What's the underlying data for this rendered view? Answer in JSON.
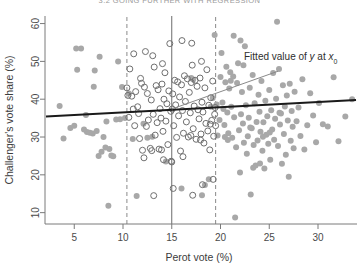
{
  "page_header": "3.2   GOING FURTHER WITH REGRESSION",
  "chart_data": {
    "type": "scatter",
    "title": "",
    "xlabel": "Perot vote (%)",
    "ylabel": "Challenger's vote share (%)",
    "xlim": [
      2.0,
      34.0
    ],
    "ylim": [
      7.0,
      62.0
    ],
    "xticks": [
      5,
      10,
      15,
      20,
      25,
      30
    ],
    "xtick_labels": [
      "5",
      "10",
      "15",
      "20",
      "25",
      "30"
    ],
    "yticks": [
      10,
      20,
      30,
      40,
      50,
      60
    ],
    "ytick_labels": [
      "10",
      "20",
      "30",
      "40",
      "50",
      "60"
    ],
    "grid": false,
    "legend": "none",
    "colors": {
      "filled_point": "#a8a8a8",
      "open_point_stroke": "#6f6f6f",
      "regression_line": "#1a1a1a",
      "local_line": "#8a8a8a",
      "reference_line_solid": "#6b6b6b",
      "reference_line_dashed": "#8a8a8a",
      "axis": "#7a7a7a",
      "text": "#3c3c3c"
    },
    "annotations": [
      {
        "name": "fitted-value-annotation",
        "text_parts": [
          "Fitted value of ",
          "y",
          " at ",
          "x",
          "0"
        ],
        "text": "Fitted value of y at x0",
        "x": 22.2,
        "y": 49.5
      }
    ],
    "reference_lines": [
      {
        "name": "x0-solid-line",
        "type": "vertical",
        "style": "solid",
        "x": 15.0
      },
      {
        "name": "bandwidth-lower-dashed-line",
        "type": "vertical",
        "style": "dashed",
        "x": 10.4
      },
      {
        "name": "bandwidth-upper-dashed-line",
        "type": "vertical",
        "style": "dashed",
        "x": 19.5
      }
    ],
    "fitted_lines": [
      {
        "name": "global-regression-line",
        "style": "thick-solid",
        "x_start": 2.1,
        "y_start": 35.4,
        "x_end": 33.9,
        "y_end": 39.8
      },
      {
        "name": "local-regression-line",
        "style": "thin-solid",
        "x_start": 15.0,
        "y_start": 37.4,
        "x_end": 25.9,
        "y_end": 47.4
      }
    ],
    "series": [
      {
        "name": "All districts",
        "marker": "filled-circle",
        "color": "#a8a8a8",
        "points": [
          [
            3.5,
            38.2
          ],
          [
            3.9,
            29.6
          ],
          [
            4.6,
            32.4
          ],
          [
            5.2,
            53.4
          ],
          [
            5.3,
            47.8
          ],
          [
            5.7,
            53.4
          ],
          [
            6.2,
            35.8
          ],
          [
            6.3,
            31.3
          ],
          [
            6.6,
            31.1
          ],
          [
            6.9,
            30.9
          ],
          [
            7.0,
            43.3
          ],
          [
            7.1,
            47.6
          ],
          [
            7.3,
            31.6
          ],
          [
            7.6,
            51.2
          ],
          [
            7.8,
            26.1
          ],
          [
            8.0,
            30.0
          ],
          [
            8.2,
            27.2
          ],
          [
            8.3,
            34.1
          ],
          [
            8.5,
            11.8
          ],
          [
            8.6,
            26.8
          ],
          [
            8.8,
            25.1
          ],
          [
            9.0,
            24.9
          ],
          [
            9.3,
            34.6
          ],
          [
            9.5,
            50.0
          ],
          [
            9.7,
            34.7
          ],
          [
            9.9,
            43.2
          ],
          [
            10.2,
            35.0
          ],
          [
            10.6,
            41.5
          ],
          [
            11.0,
            29.5
          ],
          [
            11.4,
            14.4
          ],
          [
            12.1,
            33.5
          ],
          [
            13.0,
            30.1
          ],
          [
            14.4,
            23.5
          ],
          [
            16.0,
            16.4
          ],
          [
            17.2,
            45.2
          ],
          [
            18.1,
            14.6
          ],
          [
            18.4,
            17.3
          ],
          [
            18.8,
            18.8
          ],
          [
            19.2,
            40.3
          ],
          [
            19.4,
            57.0
          ],
          [
            19.6,
            38.6
          ],
          [
            19.7,
            30.4
          ],
          [
            19.9,
            34.5
          ],
          [
            20.0,
            45.9
          ],
          [
            20.1,
            52.2
          ],
          [
            20.2,
            39.1
          ],
          [
            20.3,
            37.4
          ],
          [
            20.4,
            33.2
          ],
          [
            20.5,
            44.5
          ],
          [
            20.6,
            48.6
          ],
          [
            20.7,
            36.5
          ],
          [
            20.8,
            31.0
          ],
          [
            20.9,
            42.8
          ],
          [
            21.0,
            47.1
          ],
          [
            21.1,
            38.0
          ],
          [
            21.2,
            29.8
          ],
          [
            21.3,
            46.0
          ],
          [
            21.4,
            35.2
          ],
          [
            21.5,
            8.7
          ],
          [
            21.6,
            27.3
          ],
          [
            21.7,
            44.3
          ],
          [
            21.8,
            49.5
          ],
          [
            21.9,
            31.8
          ],
          [
            22.0,
            20.6
          ],
          [
            22.1,
            36.0
          ],
          [
            22.2,
            41.9
          ],
          [
            22.3,
            33.6
          ],
          [
            22.4,
            28.5
          ],
          [
            22.5,
            54.0
          ],
          [
            22.6,
            38.4
          ],
          [
            22.7,
            25.6
          ],
          [
            22.8,
            30.2
          ],
          [
            22.9,
            35.1
          ],
          [
            23.0,
            43.0
          ],
          [
            23.1,
            14.8
          ],
          [
            23.2,
            32.3
          ],
          [
            23.3,
            46.4
          ],
          [
            23.4,
            27.9
          ],
          [
            23.5,
            38.9
          ],
          [
            23.6,
            22.5
          ],
          [
            23.7,
            34.0
          ],
          [
            23.8,
            29.1
          ],
          [
            23.9,
            41.2
          ],
          [
            24.0,
            36.7
          ],
          [
            24.1,
            31.4
          ],
          [
            24.2,
            44.8
          ],
          [
            24.3,
            26.4
          ],
          [
            24.4,
            33.9
          ],
          [
            24.5,
            21.7
          ],
          [
            24.6,
            39.6
          ],
          [
            24.7,
            30.6
          ],
          [
            24.8,
            35.5
          ],
          [
            24.9,
            28.2
          ],
          [
            25.0,
            42.4
          ],
          [
            25.1,
            24.0
          ],
          [
            25.2,
            37.1
          ],
          [
            25.3,
            32.0
          ],
          [
            25.4,
            46.9
          ],
          [
            25.5,
            29.3
          ],
          [
            25.6,
            34.8
          ],
          [
            25.7,
            40.1
          ],
          [
            25.8,
            60.5
          ],
          [
            25.9,
            27.6
          ],
          [
            26.0,
            48.0
          ],
          [
            26.1,
            33.3
          ],
          [
            26.2,
            36.2
          ],
          [
            26.3,
            22.9
          ],
          [
            26.4,
            43.7
          ],
          [
            26.5,
            30.8
          ],
          [
            26.6,
            38.1
          ],
          [
            26.7,
            25.3
          ],
          [
            26.8,
            41.0
          ],
          [
            26.9,
            34.4
          ],
          [
            27.0,
            19.5
          ],
          [
            27.1,
            44.1
          ],
          [
            27.2,
            29.0
          ],
          [
            27.3,
            36.9
          ],
          [
            27.4,
            32.7
          ],
          [
            27.5,
            27.0
          ],
          [
            27.6,
            42.0
          ],
          [
            27.8,
            34.2
          ],
          [
            28.0,
            37.8
          ],
          [
            28.2,
            30.3
          ],
          [
            28.4,
            45.3
          ],
          [
            28.6,
            26.7
          ],
          [
            28.9,
            33.1
          ],
          [
            29.2,
            41.6
          ],
          [
            29.5,
            35.7
          ],
          [
            29.8,
            28.6
          ],
          [
            30.1,
            39.0
          ],
          [
            30.5,
            33.4
          ],
          [
            31.0,
            32.8
          ],
          [
            31.6,
            45.8
          ],
          [
            32.1,
            28.9
          ],
          [
            32.8,
            35.4
          ],
          [
            33.5,
            40.0
          ],
          [
            5.0,
            33.0
          ],
          [
            6.0,
            32.0
          ],
          [
            7.5,
            25.0
          ],
          [
            12.5,
            29.8
          ],
          [
            17.0,
            45.6
          ],
          [
            19.0,
            38.0
          ],
          [
            20.45,
            30.0
          ],
          [
            21.05,
            44.9
          ],
          [
            22.05,
            55.5
          ],
          [
            23.05,
            32.5
          ],
          [
            24.05,
            23.0
          ],
          [
            25.05,
            31.2
          ],
          [
            26.05,
            36.4
          ],
          [
            21.35,
            56.8
          ],
          [
            22.35,
            49.0
          ],
          [
            23.35,
            21.9
          ],
          [
            24.35,
            30.1
          ],
          [
            20.75,
            29.2
          ]
        ]
      },
      {
        "name": "Districts within bandwidth window (highlighted)",
        "marker": "open-circle",
        "color": "#6f6f6f",
        "points": [
          [
            10.4,
            43.0
          ],
          [
            10.5,
            41.0
          ],
          [
            10.6,
            35.2
          ],
          [
            10.9,
            40.8
          ],
          [
            11.2,
            33.0
          ],
          [
            11.3,
            42.0
          ],
          [
            11.5,
            38.0
          ],
          [
            11.6,
            36.2
          ],
          [
            11.7,
            29.6
          ],
          [
            11.9,
            44.2
          ],
          [
            12.0,
            26.5
          ],
          [
            12.2,
            43.2
          ],
          [
            12.4,
            32.8
          ],
          [
            12.5,
            41.5
          ],
          [
            12.6,
            34.5
          ],
          [
            12.8,
            27.0
          ],
          [
            12.9,
            39.8
          ],
          [
            13.1,
            36.0
          ],
          [
            13.2,
            48.5
          ],
          [
            13.3,
            30.5
          ],
          [
            13.4,
            43.6
          ],
          [
            13.5,
            33.8
          ],
          [
            13.6,
            42.5
          ],
          [
            13.7,
            26.8
          ],
          [
            13.8,
            37.5
          ],
          [
            13.9,
            35.0
          ],
          [
            14.0,
            44.0
          ],
          [
            14.1,
            31.5
          ],
          [
            14.2,
            40.0
          ],
          [
            14.3,
            47.0
          ],
          [
            14.4,
            34.2
          ],
          [
            14.5,
            38.8
          ],
          [
            14.6,
            28.0
          ],
          [
            14.7,
            42.2
          ],
          [
            14.8,
            54.7
          ],
          [
            14.9,
            36.8
          ],
          [
            15.0,
            23.4
          ],
          [
            15.1,
            41.4
          ],
          [
            15.2,
            33.0
          ],
          [
            15.3,
            45.0
          ],
          [
            15.4,
            38.5
          ],
          [
            15.5,
            29.9
          ],
          [
            15.6,
            44.6
          ],
          [
            15.7,
            35.6
          ],
          [
            15.8,
            40.6
          ],
          [
            15.9,
            26.3
          ],
          [
            16.0,
            43.8
          ],
          [
            16.1,
            37.0
          ],
          [
            16.2,
            31.0
          ],
          [
            16.3,
            46.2
          ],
          [
            16.4,
            39.4
          ],
          [
            16.5,
            34.0
          ],
          [
            16.6,
            45.4
          ],
          [
            16.7,
            30.0
          ],
          [
            16.8,
            41.8
          ],
          [
            16.9,
            36.4
          ],
          [
            17.0,
            44.4
          ],
          [
            17.1,
            49.0
          ],
          [
            17.2,
            32.2
          ],
          [
            17.3,
            38.2
          ],
          [
            17.4,
            45.0
          ],
          [
            17.5,
            29.4
          ],
          [
            17.6,
            43.4
          ],
          [
            17.7,
            37.2
          ],
          [
            17.8,
            34.8
          ],
          [
            17.9,
            45.6
          ],
          [
            18.0,
            30.8
          ],
          [
            18.1,
            39.2
          ],
          [
            18.2,
            36.6
          ],
          [
            18.3,
            28.4
          ],
          [
            18.4,
            43.0
          ],
          [
            18.5,
            33.6
          ],
          [
            18.6,
            47.8
          ],
          [
            18.7,
            31.6
          ],
          [
            18.8,
            38.4
          ],
          [
            18.9,
            26.6
          ],
          [
            19.0,
            40.4
          ],
          [
            19.1,
            34.4
          ],
          [
            19.2,
            44.8
          ],
          [
            19.3,
            30.2
          ],
          [
            19.4,
            36.0
          ],
          [
            19.5,
            33.0
          ],
          [
            11.1,
            52.0
          ],
          [
            12.3,
            52.6
          ],
          [
            13.05,
            51.5
          ],
          [
            14.05,
            49.4
          ],
          [
            10.7,
            48.0
          ],
          [
            11.8,
            45.5
          ],
          [
            16.05,
            55.5
          ],
          [
            17.05,
            54.8
          ],
          [
            18.05,
            50.0
          ],
          [
            15.15,
            16.4
          ],
          [
            17.15,
            14.6
          ],
          [
            18.15,
            17.4
          ],
          [
            13.15,
            14.5
          ],
          [
            19.25,
            18.8
          ],
          [
            12.15,
            24.5
          ],
          [
            14.15,
            24.0
          ],
          [
            16.15,
            24.8
          ],
          [
            11.05,
            37.4
          ],
          [
            15.05,
            37.4
          ],
          [
            19.45,
            37.8
          ],
          [
            14.95,
            23.6
          ],
          [
            12.95,
            26.4
          ],
          [
            13.95,
            26.6
          ],
          [
            16.95,
            30.4
          ],
          [
            17.95,
            29.2
          ],
          [
            18.95,
            33.4
          ]
        ]
      }
    ]
  }
}
